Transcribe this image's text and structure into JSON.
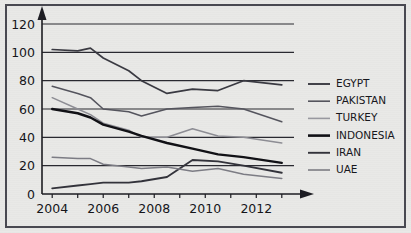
{
  "chart_data": {
    "type": "line",
    "title": "",
    "subtitle": "",
    "xlabel": "",
    "ylabel": "",
    "xlim": [
      2003.6,
      2013.4
    ],
    "ylim": [
      0,
      120
    ],
    "yticks": [
      0,
      20,
      40,
      60,
      80,
      100,
      120
    ],
    "ytick_labels": [
      "0",
      "20",
      "40",
      "60",
      "80",
      "100",
      "120"
    ],
    "xticks": [
      2004,
      2006,
      2008,
      2010,
      2012
    ],
    "xtick_labels": [
      "2004",
      "2006",
      "2008",
      "2010",
      "2012"
    ],
    "xminor_ticks": [
      2005,
      2007,
      2009,
      2011,
      2013
    ],
    "grid": "horizontal",
    "legend_position": "right",
    "x": [
      2004,
      2005,
      2005.5,
      2006,
      2007,
      2007.5,
      2008.5,
      2009.5,
      2010.5,
      2011.5,
      2013
    ],
    "series": [
      {
        "name": "EGYPT",
        "color": "#3a3a42",
        "width": 1.7,
        "values": [
          102,
          101,
          103,
          96,
          87,
          80,
          71,
          74,
          73,
          80,
          77
        ]
      },
      {
        "name": "PAKISTAN",
        "color": "#55555e",
        "width": 1.5,
        "values": [
          76,
          71,
          68,
          60,
          58,
          55,
          60,
          61,
          62,
          60,
          51
        ]
      },
      {
        "name": "TURKEY",
        "color": "#8e8e95",
        "width": 1.5,
        "values": [
          68,
          60,
          56,
          50,
          45,
          40,
          40,
          46,
          41,
          40,
          36
        ]
      },
      {
        "name": "INDONESIA",
        "color": "#111116",
        "width": 2.4,
        "values": [
          60,
          57,
          54,
          49,
          44,
          41,
          36,
          32,
          28,
          26,
          22
        ]
      },
      {
        "name": "IRAN",
        "color": "#33333b",
        "width": 1.8,
        "values": [
          4,
          6,
          7,
          8,
          8,
          9,
          12,
          24,
          23,
          20,
          15
        ]
      },
      {
        "name": "UAE",
        "color": "#7d7d85",
        "width": 1.5,
        "values": [
          26,
          25,
          25,
          21,
          19,
          18,
          19,
          16,
          18,
          14,
          11
        ]
      }
    ],
    "legend_entries": [
      {
        "label": "EGYPT",
        "color": "#3a3a42",
        "width": 1.9
      },
      {
        "label": "PAKISTAN",
        "color": "#55555e",
        "width": 1.6
      },
      {
        "label": "TURKEY",
        "color": "#9a9aa1",
        "width": 1.6
      },
      {
        "label": "INDONESIA",
        "color": "#111116",
        "width": 2.6
      },
      {
        "label": "IRAN",
        "color": "#33333b",
        "width": 1.9
      },
      {
        "label": "UAE",
        "color": "#7d7d85",
        "width": 1.6
      }
    ]
  },
  "axes": {
    "y_arrow": "up-arrow-icon",
    "x_arrow": "right-arrow-icon"
  }
}
